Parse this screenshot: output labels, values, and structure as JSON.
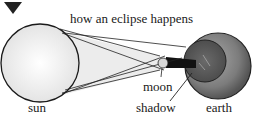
{
  "title": "how an eclipse happens",
  "labels": {
    "sun": "sun",
    "moon": "moon",
    "shadow": "shadow",
    "earth": "earth"
  },
  "colors": {
    "ink": "#1a1a1a",
    "sun_fill": "#f4f4f4",
    "earth_outer": "#8a8a8a",
    "earth_inner": "#6e6e6e",
    "shadow": "#111111",
    "beam": "#e6e6e6"
  },
  "icons": {
    "marker": "down-triangle-icon"
  }
}
